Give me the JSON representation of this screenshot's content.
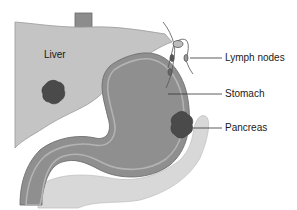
{
  "diagram": {
    "labels": {
      "liver": "Liver",
      "lymph_nodes": "Lymph nodes",
      "stomach": "Stomach",
      "pancreas": "Pancreas"
    },
    "colors": {
      "background": "#ffffff",
      "liver": "#c4c4c4",
      "stomach_wall": "#8f8f8f",
      "stomach_lining": "#b0b0b0",
      "stomach_inner": "#8a8a8a",
      "tumor": "#4a4a4a",
      "pancreas": "#d8d8d8",
      "esophagus": "#8c8c8c",
      "leader_line": "#333333"
    }
  }
}
